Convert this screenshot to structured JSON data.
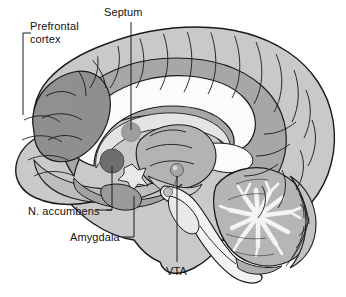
{
  "figure": {
    "background_color": "#ffffff",
    "width": 346,
    "height": 297
  },
  "labels": {
    "prefrontal_cortex": "Prefrontal\ncortex",
    "prefrontal_cortex_line1": "Prefrontal",
    "prefrontal_cortex_line2": "cortex",
    "septum": "Septum",
    "n_accumbens": "N. accumbens",
    "amygdala": "Amygdala",
    "vta": "VTA"
  },
  "colors": {
    "outline": "#1a1a1a",
    "cortex_light": "#c9c9c9",
    "cortex_mid": "#b0b0b0",
    "cortex_dark": "#8f8f8f",
    "deep_gray": "#9a9a9a",
    "accumbens_dot": "#6e6e6e",
    "septum_dot": "#9d9d9d",
    "vta_dot": "#a0a0a0",
    "corpus_callosum": "#fbfbfb",
    "brainstem": "#f2f2f2",
    "cerebellum_white": "#f4f4f4",
    "text": "#111111",
    "leader_line": "#1a1a1a"
  },
  "structures": [
    {
      "name": "prefrontal-cortex",
      "shading": "dark",
      "label": "Prefrontal cortex"
    },
    {
      "name": "septum",
      "shading": "dot",
      "label": "Septum"
    },
    {
      "name": "nucleus-accumbens",
      "shading": "dark-dot",
      "label": "N. accumbens"
    },
    {
      "name": "amygdala",
      "shading": "mid",
      "label": "Amygdala"
    },
    {
      "name": "ventral-tegmental-area",
      "shading": "sphere",
      "label": "VTA"
    },
    {
      "name": "corpus-callosum",
      "shading": "white",
      "label": ""
    },
    {
      "name": "cerebellum",
      "shading": "arbor-vitae",
      "label": ""
    },
    {
      "name": "brainstem",
      "shading": "white",
      "label": ""
    },
    {
      "name": "cerebral-cortex",
      "shading": "light",
      "label": ""
    }
  ]
}
